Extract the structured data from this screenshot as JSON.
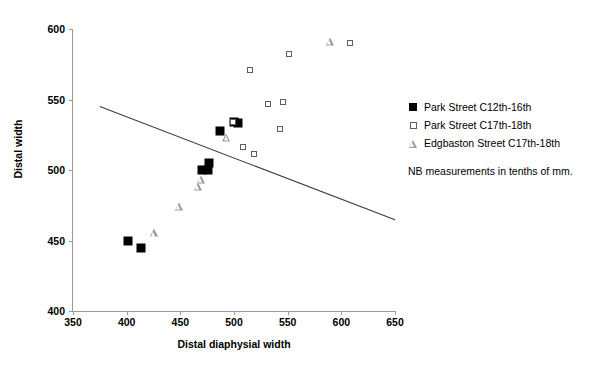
{
  "chart_data": {
    "type": "scatter",
    "title": "",
    "xlabel": "Distal diaphysial width",
    "ylabel": "Distal width",
    "xlim": [
      350,
      650
    ],
    "ylim": [
      400,
      600
    ],
    "xticks": [
      350,
      400,
      450,
      500,
      550,
      600,
      650
    ],
    "yticks": [
      400,
      450,
      500,
      550,
      600
    ],
    "grid": false,
    "legend_position": "right",
    "note": "NB measurements in tenths of mm.",
    "series": [
      {
        "name": "Park Street C12th-16th",
        "marker": "filled-square",
        "color": "#000000",
        "points": [
          [
            401,
            450
          ],
          [
            413,
            445
          ],
          [
            470,
            500
          ],
          [
            476,
            500
          ],
          [
            477,
            505
          ],
          [
            487,
            528
          ],
          [
            500,
            534
          ],
          [
            504,
            533
          ]
        ]
      },
      {
        "name": "Park Street C17th-18th",
        "marker": "open-square",
        "color": "#5e5e5e",
        "points": [
          [
            499,
            534
          ],
          [
            508,
            516
          ],
          [
            515,
            571
          ],
          [
            519,
            511
          ],
          [
            532,
            547
          ],
          [
            543,
            529
          ],
          [
            546,
            548
          ],
          [
            551,
            582
          ],
          [
            608,
            590
          ]
        ]
      },
      {
        "name": "Edgbaston Street C17th-18th",
        "marker": "open-triangle",
        "color": "#9a9a9a",
        "points": [
          [
            425,
            455
          ],
          [
            449,
            474
          ],
          [
            466,
            488
          ],
          [
            469,
            493
          ],
          [
            493,
            523
          ],
          [
            589,
            591
          ]
        ]
      }
    ],
    "trend_line": {
      "x_start": 375,
      "y_start": 545,
      "x_end": 666,
      "y_end": 460,
      "color": "#3a3a3a"
    }
  },
  "axes": {
    "x_title": "Distal diaphysial width",
    "y_title": "Distal width",
    "x_tick_labels": [
      "350",
      "400",
      "450",
      "500",
      "550",
      "600",
      "650"
    ],
    "y_tick_labels": [
      "400",
      "450",
      "500",
      "550",
      "600"
    ]
  },
  "legend": {
    "entries": [
      {
        "label": "Park Street C12th-16th",
        "marker": "filled-square"
      },
      {
        "label": "Park Street C17th-18th",
        "marker": "open-square"
      },
      {
        "label": "Edgbaston Street C17th-18th",
        "marker": "open-triangle"
      }
    ],
    "note": "NB measurements in tenths of mm."
  }
}
